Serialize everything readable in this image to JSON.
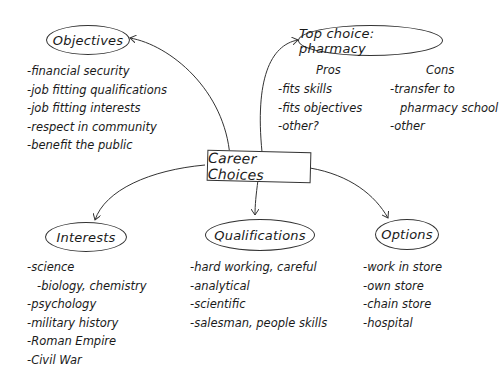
{
  "center": {
    "label": "Career Choices"
  },
  "objectives": {
    "label": "Objectives",
    "items": [
      "-financial security",
      "-job fitting qualifications",
      "-job fitting interests",
      "-respect in community",
      "-benefit the public"
    ]
  },
  "top_choice": {
    "label": "Top choice: pharmacy",
    "pros_header": "Pros",
    "pros": [
      "-fits skills",
      "-fits objectives",
      "-other?"
    ],
    "cons_header": "Cons",
    "cons": [
      "-transfer to",
      "pharmacy school",
      "-other"
    ]
  },
  "interests": {
    "label": "Interests",
    "items": [
      "-science",
      "-biology, chemistry",
      "-psychology",
      "-military history",
      "-Roman Empire",
      "-Civil War"
    ]
  },
  "qualifications": {
    "label": "Qualifications",
    "items": [
      "-hard working, careful",
      "-analytical",
      "-scientific",
      "-salesman, people skills"
    ]
  },
  "options": {
    "label": "Options",
    "items": [
      "-work in store",
      "-own store",
      "-chain store",
      "-hospital"
    ]
  }
}
